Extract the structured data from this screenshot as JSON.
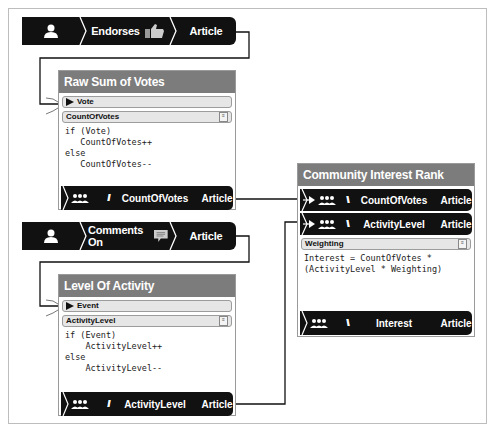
{
  "diagram": {
    "events": [
      {
        "actor_icon": "person-icon",
        "verb": "Endorses",
        "verb_icon": "thumbs-up-icon",
        "object": "Article"
      },
      {
        "actor_icon": "person-icon",
        "verb": "Comments On",
        "verb_icon": "speech-bubble-icon",
        "object": "Article"
      }
    ],
    "nodes": [
      {
        "title": "Raw Sum of Votes",
        "input": "Vote",
        "variable": "CountOfVotes",
        "code": "if (Vote)\n   CountOfVotes++\nelse\n   CountOfVotes--",
        "output": {
          "icon": "group-icon",
          "label": "CountOfVotes",
          "object": "Article"
        }
      },
      {
        "title": "Level Of Activity",
        "input": "Event",
        "variable": "ActivityLevel",
        "code": "if (Event)\n    ActivityLevel++\nelse\n    ActivityLevel--",
        "output": {
          "icon": "group-icon",
          "label": "ActivityLevel",
          "object": "Article"
        }
      },
      {
        "title": "Community Interest Rank",
        "inputs": [
          {
            "icon": "group-icon",
            "label": "CountOfVotes",
            "object": "Article"
          },
          {
            "icon": "group-icon",
            "label": "ActivityLevel",
            "object": "Article"
          }
        ],
        "variable": "Weighting",
        "code": "Interest = CountOfVotes *\n(ActivityLevel * Weighting)",
        "output": {
          "icon": "group-icon",
          "label": "Interest",
          "object": "Article"
        }
      }
    ]
  },
  "colors": {
    "bar": "#111111",
    "title_bar": "#7c7c7c",
    "slot": "#e6e6e6",
    "frame": "#bdbdbd"
  }
}
